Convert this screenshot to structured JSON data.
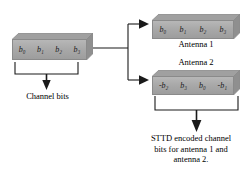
{
  "diagram": {
    "title_hidden": "STTD encoding block diagram",
    "input_block": {
      "name": "channel-bits-block",
      "cells": [
        "b₀",
        "b₁",
        "b₂",
        "b₃"
      ],
      "caption": "Channel bits"
    },
    "antenna1_block": {
      "name": "antenna-1-block",
      "cells": [
        "b₀",
        "b₁",
        "b₂",
        "b₃"
      ],
      "caption": "Antenna 1"
    },
    "antenna2_block": {
      "name": "antenna-2-block",
      "cells": [
        "-b₂",
        "b₃",
        "b₀",
        "-b₁"
      ],
      "caption": "Antenna 2"
    },
    "output_caption": {
      "line1": "STTD encoded channel",
      "line2": "bits for antenna 1 and",
      "line3": "antenna 2."
    },
    "colors": {
      "box_face_light": "#b7b7b7",
      "box_face_dark": "#9d9d9d",
      "box_bevel": "#8f8f8f",
      "box_border": "#8a8a8a",
      "line": "#1a1a1a",
      "background": "#ffffff"
    }
  }
}
